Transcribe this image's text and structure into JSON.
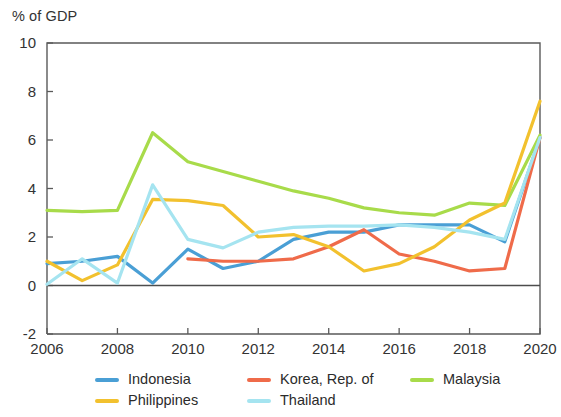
{
  "chart_data": {
    "type": "line",
    "title": "% of GDP",
    "xlabel": "",
    "ylabel": "% of GDP",
    "xlim": [
      2006,
      2020
    ],
    "ylim": [
      -2,
      10
    ],
    "yticks": [
      10,
      8,
      6,
      4,
      2,
      0,
      -2
    ],
    "xticks": [
      2006,
      2008,
      2010,
      2012,
      2014,
      2016,
      2018,
      2020
    ],
    "grid": false,
    "legend_position": "below",
    "x": [
      2006,
      2007,
      2008,
      2009,
      2010,
      2011,
      2012,
      2013,
      2014,
      2015,
      2016,
      2017,
      2018,
      2019,
      2020
    ],
    "series": [
      {
        "name": "Indonesia",
        "color": "#4a9fd5",
        "values": [
          0.9,
          1.0,
          1.2,
          0.1,
          1.5,
          0.7,
          1.0,
          1.9,
          2.2,
          2.2,
          2.5,
          2.5,
          2.5,
          1.8,
          6.1
        ]
      },
      {
        "name": "Korea, Rep. of",
        "color": "#ef6b4a",
        "values": [
          null,
          null,
          null,
          null,
          1.1,
          1.0,
          1.0,
          1.1,
          1.6,
          2.3,
          1.3,
          1.0,
          0.6,
          0.7,
          6.1
        ]
      },
      {
        "name": "Malaysia",
        "color": "#a8db4a",
        "values": [
          3.1,
          3.05,
          3.1,
          6.3,
          5.1,
          4.7,
          4.3,
          3.9,
          3.6,
          3.2,
          3.0,
          2.9,
          3.4,
          3.3,
          6.2
        ]
      },
      {
        "name": "Philippines",
        "color": "#f2c12e",
        "values": [
          1.0,
          0.2,
          0.85,
          3.55,
          3.5,
          3.3,
          2.0,
          2.1,
          1.6,
          0.6,
          0.9,
          1.6,
          2.7,
          3.4,
          7.6
        ]
      },
      {
        "name": "Thailand",
        "color": "#a5e4f0",
        "values": [
          0.05,
          1.1,
          0.1,
          4.15,
          1.9,
          1.55,
          2.2,
          2.4,
          2.45,
          2.45,
          2.5,
          2.4,
          2.2,
          1.9,
          6.1
        ]
      }
    ]
  },
  "axis": {
    "y_title": "% of GDP",
    "y_ticks": [
      {
        "label": "10",
        "value": 10
      },
      {
        "label": "8",
        "value": 8
      },
      {
        "label": "6",
        "value": 6
      },
      {
        "label": "4",
        "value": 4
      },
      {
        "label": "2",
        "value": 2
      },
      {
        "label": "0",
        "value": 0
      },
      {
        "label": "-2",
        "value": -2
      }
    ],
    "x_ticks": [
      {
        "label": "2006",
        "value": 2006
      },
      {
        "label": "2008",
        "value": 2008
      },
      {
        "label": "2010",
        "value": 2010
      },
      {
        "label": "2012",
        "value": 2012
      },
      {
        "label": "2014",
        "value": 2014
      },
      {
        "label": "2016",
        "value": 2016
      },
      {
        "label": "2018",
        "value": 2018
      },
      {
        "label": "2020",
        "value": 2020
      }
    ]
  },
  "legend": {
    "items": [
      {
        "label": "Indonesia",
        "color": "#4a9fd5",
        "row": 1,
        "col": 1
      },
      {
        "label": "Korea, Rep. of",
        "color": "#ef6b4a",
        "row": 1,
        "col": 2
      },
      {
        "label": "Malaysia",
        "color": "#a8db4a",
        "row": 1,
        "col": 3
      },
      {
        "label": "Philippines",
        "color": "#f2c12e",
        "row": 2,
        "col": 1
      },
      {
        "label": "Thailand",
        "color": "#a5e4f0",
        "row": 2,
        "col": 2
      }
    ]
  }
}
